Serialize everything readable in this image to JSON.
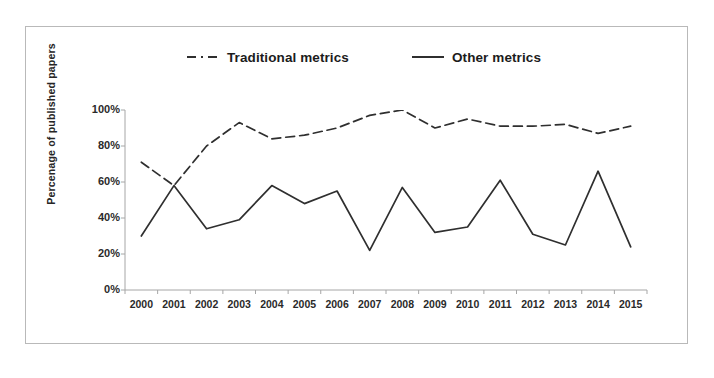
{
  "figure": {
    "background_color": "#ffffff",
    "frame_color": "#b9b9b9",
    "line_color": "#2f2f2f"
  },
  "legend": {
    "position": "top-center",
    "entries": [
      {
        "label": "Traditional metrics",
        "style": "dashed",
        "icon": "dashed-line-swatch"
      },
      {
        "label": "Other metrics",
        "style": "solid",
        "icon": "solid-line-swatch"
      }
    ]
  },
  "axes": {
    "y_title": "Percenage of published papers",
    "y_ticks": [
      "100%",
      "80%",
      "60%",
      "40%",
      "20%",
      "0%"
    ],
    "x_ticks": [
      "2000",
      "2001",
      "2002",
      "2003",
      "2004",
      "2005",
      "2006",
      "2007",
      "2008",
      "2009",
      "2010",
      "2011",
      "2012",
      "2013",
      "2014",
      "2015"
    ]
  },
  "chart_data": {
    "type": "line",
    "title": "",
    "xlabel": "",
    "ylabel": "Percenage of published papers",
    "ylim": [
      0,
      100
    ],
    "ytick_values": [
      0,
      20,
      40,
      60,
      80,
      100
    ],
    "ytick_labels": [
      "0%",
      "20%",
      "40%",
      "60%",
      "80%",
      "100%"
    ],
    "grid": false,
    "legend_position": "top-center",
    "x": [
      "2000",
      "2001",
      "2002",
      "2003",
      "2004",
      "2005",
      "2006",
      "2007",
      "2008",
      "2009",
      "2010",
      "2011",
      "2012",
      "2013",
      "2014",
      "2015"
    ],
    "series": [
      {
        "name": "Traditional metrics",
        "style": "dashed",
        "color": "#2f2f2f",
        "values": [
          71,
          58,
          80,
          93,
          84,
          86,
          90,
          97,
          100,
          90,
          95,
          91,
          91,
          92,
          87,
          91
        ]
      },
      {
        "name": "Other metrics",
        "style": "solid",
        "color": "#2f2f2f",
        "values": [
          30,
          58,
          34,
          39,
          58,
          48,
          55,
          22,
          57,
          32,
          35,
          61,
          31,
          25,
          66,
          24
        ]
      }
    ]
  }
}
